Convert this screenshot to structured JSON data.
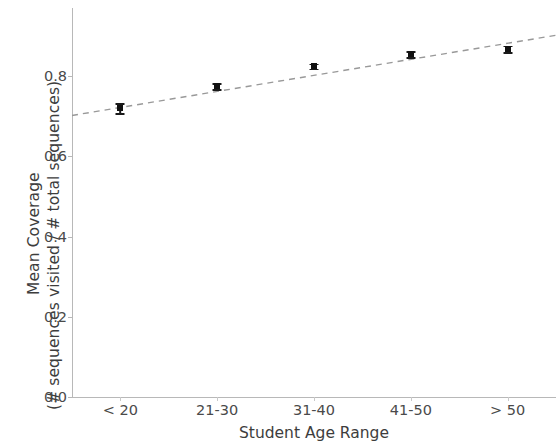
{
  "chart_data": {
    "type": "scatter",
    "title": "",
    "xlabel": "Student Age Range",
    "ylabel_line1": "Mean Coverage",
    "ylabel_line2": "(# sequences visited / # total sequences)",
    "categories": [
      "< 20",
      "21-30",
      "31-40",
      "41-50",
      "> 50"
    ],
    "values": [
      0.72,
      0.775,
      0.825,
      0.855,
      0.868
    ],
    "errors": [
      0.012,
      0.007,
      0.006,
      0.008,
      0.008
    ],
    "ylim": [
      0.0,
      0.97
    ],
    "yticks": [
      "0.0",
      "0.2",
      "0.4",
      "0.6",
      "0.8"
    ],
    "ytick_values": [
      0.0,
      0.2,
      0.4,
      0.6,
      0.8
    ],
    "grid": false,
    "legend": null,
    "trendline": {
      "style": "dashed",
      "color": "#999999",
      "x_start": 0,
      "y_start": 0.722,
      "x_end": 4,
      "y_end": 0.882
    },
    "marker_color": "#111111",
    "axis_color": "#b8b8b8",
    "text_color": "#3d3d3d"
  }
}
